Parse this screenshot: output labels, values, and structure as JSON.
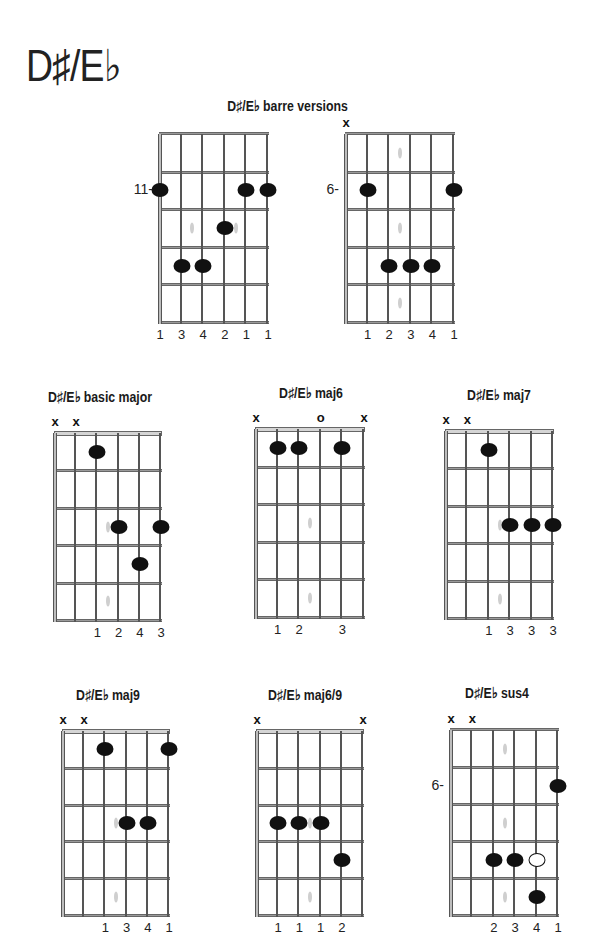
{
  "page": {
    "title": "D♯/E♭"
  },
  "sections": {
    "barre_title": "D♯/E♭ barre versions"
  },
  "diagrams": [
    {
      "id": "barre-1",
      "title": "",
      "left": 159,
      "top": 134,
      "width": 108,
      "height": 188,
      "nut": false,
      "fret_label": "11-",
      "fret_label_row": 2,
      "markers": [],
      "dots": [
        [
          0,
          2
        ],
        [
          4,
          2
        ],
        [
          5,
          2
        ],
        [
          3,
          3
        ],
        [
          1,
          4
        ],
        [
          2,
          4
        ]
      ],
      "open_dots": [],
      "inlays": [
        [
          1.5,
          3
        ],
        [
          3.5,
          3
        ]
      ],
      "fingers": [
        [
          0,
          "1"
        ],
        [
          1,
          "3"
        ],
        [
          2,
          "4"
        ],
        [
          3,
          "2"
        ],
        [
          4,
          "1"
        ],
        [
          5,
          "1"
        ]
      ]
    },
    {
      "id": "barre-2",
      "title": "",
      "left": 345,
      "top": 134,
      "width": 108,
      "height": 188,
      "nut": false,
      "fret_label": "6-",
      "fret_label_row": 2,
      "markers": [
        [
          0,
          "x"
        ]
      ],
      "dots": [
        [
          1,
          2
        ],
        [
          5,
          2
        ],
        [
          2,
          4
        ],
        [
          3,
          4
        ],
        [
          4,
          4
        ]
      ],
      "open_dots": [],
      "inlays": [
        [
          2.5,
          1
        ],
        [
          2.5,
          3
        ],
        [
          2.5,
          5
        ]
      ],
      "fingers": [
        [
          1,
          "1"
        ],
        [
          2,
          "2"
        ],
        [
          3,
          "3"
        ],
        [
          4,
          "4"
        ],
        [
          5,
          "1"
        ]
      ]
    },
    {
      "id": "basic-major",
      "title": "D♯/E♭ basic major",
      "title_x": 100,
      "title_y": 388,
      "left": 54,
      "top": 433,
      "width": 106,
      "height": 187,
      "nut": true,
      "fret_label": "",
      "fret_label_row": 0,
      "markers": [
        [
          0,
          "x"
        ],
        [
          1,
          "x"
        ]
      ],
      "dots": [
        [
          2,
          1
        ],
        [
          3,
          3
        ],
        [
          5,
          3
        ],
        [
          4,
          4
        ]
      ],
      "open_dots": [],
      "inlays": [
        [
          2.5,
          3
        ],
        [
          2.5,
          5
        ]
      ],
      "fingers": [
        [
          2,
          "1"
        ],
        [
          3,
          "2"
        ],
        [
          4,
          "4"
        ],
        [
          5,
          "3"
        ]
      ]
    },
    {
      "id": "maj6",
      "title": "D♯/E♭ maj6",
      "title_x": 311,
      "title_y": 384,
      "left": 255,
      "top": 429,
      "width": 108,
      "height": 188,
      "nut": true,
      "fret_label": "",
      "fret_label_row": 0,
      "markers": [
        [
          0,
          "x"
        ],
        [
          3,
          "o"
        ],
        [
          5,
          "x"
        ]
      ],
      "dots": [
        [
          1,
          1
        ],
        [
          2,
          1
        ],
        [
          4,
          1
        ]
      ],
      "open_dots": [],
      "inlays": [
        [
          2.5,
          3
        ],
        [
          2.5,
          5
        ]
      ],
      "fingers": [
        [
          1,
          "1"
        ],
        [
          2,
          "2"
        ],
        [
          4,
          "3"
        ]
      ]
    },
    {
      "id": "maj7",
      "title": "D♯/E♭ maj7",
      "title_x": 499,
      "title_y": 386,
      "left": 445,
      "top": 431,
      "width": 107,
      "height": 187,
      "nut": true,
      "fret_label": "",
      "fret_label_row": 0,
      "markers": [
        [
          0,
          "x"
        ],
        [
          1,
          "x"
        ]
      ],
      "dots": [
        [
          2,
          1
        ],
        [
          3,
          3
        ],
        [
          4,
          3
        ],
        [
          5,
          3
        ]
      ],
      "open_dots": [],
      "inlays": [
        [
          2.5,
          3
        ],
        [
          2.5,
          5
        ]
      ],
      "fingers": [
        [
          2,
          "1"
        ],
        [
          3,
          "3"
        ],
        [
          4,
          "3"
        ],
        [
          5,
          "3"
        ]
      ]
    },
    {
      "id": "maj9",
      "title": "D♯/E♭ maj9",
      "title_x": 108,
      "title_y": 686,
      "left": 62,
      "top": 731,
      "width": 106,
      "height": 184,
      "nut": true,
      "fret_label": "",
      "fret_label_row": 0,
      "markers": [
        [
          0,
          "x"
        ],
        [
          1,
          "x"
        ]
      ],
      "dots": [
        [
          2,
          1
        ],
        [
          5,
          1
        ],
        [
          3,
          3
        ],
        [
          4,
          3
        ]
      ],
      "open_dots": [],
      "inlays": [
        [
          2.5,
          3
        ],
        [
          2.5,
          5
        ]
      ],
      "fingers": [
        [
          2,
          "1"
        ],
        [
          3,
          "3"
        ],
        [
          4,
          "4"
        ],
        [
          5,
          "1"
        ]
      ]
    },
    {
      "id": "maj6-9",
      "title": "D♯/E♭ maj6/9",
      "title_x": 305,
      "title_y": 686,
      "left": 256,
      "top": 731,
      "width": 106,
      "height": 184,
      "nut": true,
      "fret_label": "",
      "fret_label_row": 0,
      "markers": [
        [
          0,
          "x"
        ],
        [
          5,
          "x"
        ]
      ],
      "dots": [
        [
          1,
          3
        ],
        [
          2,
          3
        ],
        [
          3,
          3
        ],
        [
          4,
          4
        ]
      ],
      "open_dots": [],
      "inlays": [
        [
          2.5,
          3
        ],
        [
          2.5,
          5
        ]
      ],
      "fingers": [
        [
          1,
          "1"
        ],
        [
          2,
          "1"
        ],
        [
          3,
          "1"
        ],
        [
          4,
          "2"
        ]
      ]
    },
    {
      "id": "sus4",
      "title": "D♯/E♭ sus4",
      "title_x": 497,
      "title_y": 684,
      "left": 450,
      "top": 730,
      "width": 107,
      "height": 185,
      "nut": false,
      "fret_label": "6-",
      "fret_label_row": 2,
      "markers": [
        [
          0,
          "x"
        ],
        [
          1,
          "x"
        ]
      ],
      "dots": [
        [
          5,
          2
        ],
        [
          2,
          4
        ],
        [
          3,
          4
        ],
        [
          4,
          5
        ]
      ],
      "open_dots": [
        [
          4,
          4
        ]
      ],
      "inlays": [
        [
          2.5,
          1
        ],
        [
          2.5,
          3
        ],
        [
          2.5,
          5
        ]
      ],
      "fingers": [
        [
          2,
          "2"
        ],
        [
          3,
          "3"
        ],
        [
          4,
          "4"
        ],
        [
          5,
          "1"
        ]
      ]
    }
  ],
  "colors": {
    "dot": "#111111",
    "string": "#bdbdbd",
    "fret": "#9a9a9a",
    "inlay": "#cfcfcf",
    "text": "#1a1a1a"
  }
}
